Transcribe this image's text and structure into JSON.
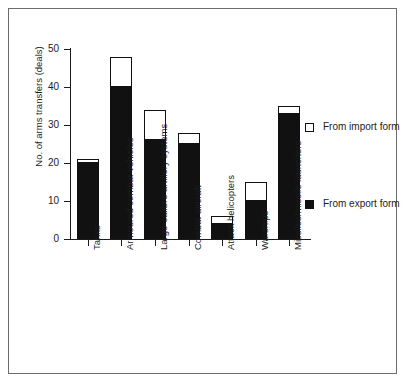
{
  "chart_data": {
    "type": "bar",
    "subtype": "stacked-vertical",
    "title": "",
    "xlabel": "",
    "ylabel": "No. of arms transfers (deals)",
    "ylim": [
      0,
      50
    ],
    "yticks": [
      0,
      10,
      20,
      30,
      40,
      50
    ],
    "grid": false,
    "legend_position": "right",
    "categories": [
      "Tanks",
      "Armoured combat vehicles",
      "Large-calibre artillery systems",
      "Combat aircraft",
      "Attack helicopters",
      "Warships",
      "Missiles/missile launchers"
    ],
    "series": [
      {
        "name": "From export form",
        "color": "#111111",
        "values": [
          20,
          40,
          26,
          25,
          4,
          10,
          33
        ]
      },
      {
        "name": "From import form",
        "color": "#ffffff",
        "values": [
          1,
          8,
          8,
          3,
          2,
          5,
          2
        ]
      }
    ],
    "totals": [
      21,
      48,
      34,
      28,
      6,
      15,
      35
    ]
  },
  "axis": {
    "y_title": "No. of arms transfers (deals)",
    "y_tick_labels": [
      "50",
      "40",
      "30",
      "20",
      "10",
      "0"
    ]
  },
  "legend": {
    "items": [
      {
        "label": "From import form",
        "swatch": "hollow-square-icon"
      },
      {
        "label": "From export form",
        "swatch": "filled-square-icon"
      }
    ]
  }
}
